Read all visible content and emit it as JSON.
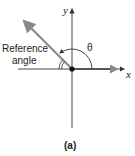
{
  "diagram": {
    "type": "angle-in-standard-position",
    "axes": {
      "x_label": "x",
      "y_label": "y"
    },
    "angle_label": "θ",
    "reference_angle_label_line1": "Reference",
    "reference_angle_label_line2": "angle",
    "caption": "(a)",
    "colors": {
      "axis": "#333333",
      "terminal_ray": "#8a8a8a",
      "initial_ray": "#555555",
      "origin": "#111111"
    }
  }
}
